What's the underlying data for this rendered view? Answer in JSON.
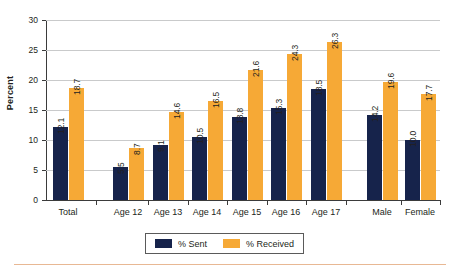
{
  "chart_data": {
    "type": "bar",
    "title": "",
    "xlabel": "",
    "ylabel": "Percent",
    "ylim": [
      0,
      30
    ],
    "ytick_step": 5,
    "yticks": [
      "0",
      "5",
      "10",
      "15",
      "20",
      "25",
      "30"
    ],
    "grid": true,
    "legend_position": "bottom-center",
    "categories": [
      "Total",
      "Age 12",
      "Age 13",
      "Age 14",
      "Age 15",
      "Age 16",
      "Age 17",
      "Male",
      "Female"
    ],
    "series": [
      {
        "name": "% Sent",
        "color": "#16234b",
        "values": [
          12.1,
          5.5,
          9.1,
          10.5,
          13.8,
          15.3,
          18.5,
          14.2,
          10.0
        ],
        "labels": [
          "12.1",
          "5.5",
          "9.1",
          "10.5",
          "13.8",
          "15.3",
          "18.5",
          "14.2",
          "10.0"
        ]
      },
      {
        "name": "% Received",
        "color": "#f6a936",
        "values": [
          18.7,
          8.7,
          14.6,
          16.5,
          21.6,
          24.3,
          26.3,
          19.6,
          17.7
        ],
        "labels": [
          "18.7",
          "8.7",
          "14.6",
          "16.5",
          "21.6",
          "24.3",
          "26.3",
          "19.6",
          "17.7"
        ]
      }
    ]
  },
  "legend": {
    "items": [
      {
        "label": "% Sent",
        "color": "#16234b"
      },
      {
        "label": "% Received",
        "color": "#f6a936"
      }
    ]
  },
  "colors": {
    "sent": "#16234b",
    "received": "#f6a936",
    "gridline": "#c9cacb",
    "axis": "#3b3b3b",
    "text": "#231f20",
    "rule": "#e8b894"
  }
}
